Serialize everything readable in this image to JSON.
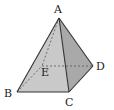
{
  "diagram": {
    "type": "pyramid",
    "vertices": {
      "A": {
        "label": "A",
        "x": 59,
        "y": 18,
        "label_x": 54,
        "label_y": 13
      },
      "B": {
        "label": "B",
        "x": 17,
        "y": 92,
        "label_x": 5,
        "label_y": 97
      },
      "C": {
        "label": "C",
        "x": 69,
        "y": 92,
        "label_x": 65,
        "label_y": 106
      },
      "D": {
        "label": "D",
        "x": 93,
        "y": 66,
        "label_x": 96,
        "label_y": 70
      },
      "E": {
        "label": "E",
        "x": 42,
        "y": 66,
        "label_x": 41,
        "label_y": 76
      }
    },
    "edges_solid": [
      [
        "A",
        "B"
      ],
      [
        "A",
        "C"
      ],
      [
        "A",
        "D"
      ],
      [
        "B",
        "C"
      ],
      [
        "C",
        "D"
      ]
    ],
    "edges_hidden": [
      [
        "A",
        "E"
      ],
      [
        "B",
        "E"
      ],
      [
        "E",
        "D"
      ]
    ],
    "faces": [
      {
        "name": "face-ABC",
        "points": [
          "A",
          "B",
          "C"
        ],
        "fill": "#c9c9c9"
      },
      {
        "name": "face-ACD",
        "points": [
          "A",
          "C",
          "D"
        ],
        "fill": "#a9a9a9"
      }
    ],
    "colors": {
      "stroke": "#333333",
      "hidden_stroke": "#555555",
      "background": "#ffffff"
    }
  }
}
